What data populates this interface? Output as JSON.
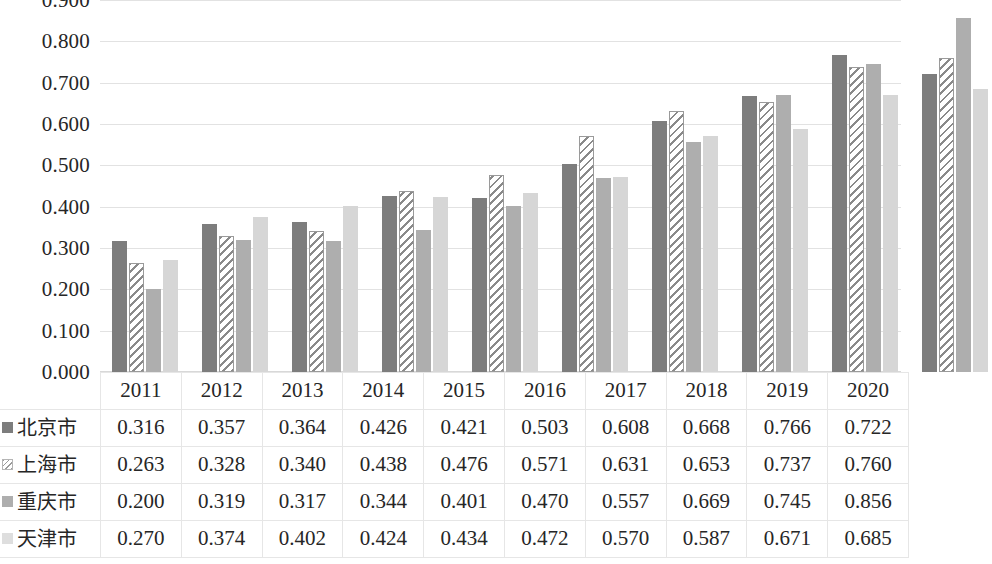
{
  "chart_data": {
    "type": "bar",
    "title": "",
    "xlabel": "",
    "ylabel": "",
    "ylim": [
      0.0,
      0.9
    ],
    "ytick_step": 0.1,
    "grid": true,
    "legend_position": "table-row-labels",
    "categories": [
      "2011",
      "2012",
      "2013",
      "2014",
      "2015",
      "2016",
      "2017",
      "2018",
      "2019",
      "2020"
    ],
    "series": [
      {
        "name": "北京市",
        "marker": "solid-dark-gray",
        "color": "#7d7d7d",
        "values": [
          0.316,
          0.357,
          0.364,
          0.426,
          0.421,
          0.503,
          0.608,
          0.668,
          0.766,
          0.722
        ]
      },
      {
        "name": "上海市",
        "marker": "diagonal-hatch-white",
        "color": "#ffffff",
        "values": [
          0.263,
          0.328,
          0.34,
          0.438,
          0.476,
          0.571,
          0.631,
          0.653,
          0.737,
          0.76
        ]
      },
      {
        "name": "重庆市",
        "marker": "solid-medium-gray",
        "color": "#aeaeae",
        "values": [
          0.2,
          0.319,
          0.317,
          0.344,
          0.401,
          0.47,
          0.557,
          0.669,
          0.745,
          0.856
        ]
      },
      {
        "name": "天津市",
        "marker": "solid-light-gray",
        "color": "#d6d6d6",
        "values": [
          0.27,
          0.374,
          0.402,
          0.424,
          0.434,
          0.472,
          0.57,
          0.587,
          0.671,
          0.685
        ]
      }
    ],
    "ytick_labels": [
      "0.900",
      "0.800",
      "0.700",
      "0.600",
      "0.500",
      "0.400",
      "0.300",
      "0.200",
      "0.100",
      "0.000"
    ],
    "ytick_values": [
      0.9,
      0.8,
      0.7,
      0.6,
      0.5,
      0.4,
      0.3,
      0.2,
      0.1,
      0.0
    ]
  },
  "table": {
    "corner_label": "",
    "column_headers": [
      "2011",
      "2012",
      "2013",
      "2014",
      "2015",
      "2016",
      "2017",
      "2018",
      "2019",
      "2020"
    ],
    "rows": [
      {
        "label": "北京市",
        "swatch": "sw1",
        "cells": [
          "0.316",
          "0.357",
          "0.364",
          "0.426",
          "0.421",
          "0.503",
          "0.608",
          "0.668",
          "0.766",
          "0.722"
        ]
      },
      {
        "label": "上海市",
        "swatch": "sw2",
        "cells": [
          "0.263",
          "0.328",
          "0.340",
          "0.438",
          "0.476",
          "0.571",
          "0.631",
          "0.653",
          "0.737",
          "0.760"
        ]
      },
      {
        "label": "重庆市",
        "swatch": "sw3",
        "cells": [
          "0.200",
          "0.319",
          "0.317",
          "0.344",
          "0.401",
          "0.470",
          "0.557",
          "0.669",
          "0.745",
          "0.856"
        ]
      },
      {
        "label": "天津市",
        "swatch": "sw4",
        "cells": [
          "0.270",
          "0.374",
          "0.402",
          "0.424",
          "0.434",
          "0.472",
          "0.570",
          "0.587",
          "0.671",
          "0.685"
        ]
      }
    ]
  },
  "colors": {
    "series1": "#7d7d7d",
    "series2": "#ffffff",
    "series3": "#aeaeae",
    "series4": "#d6d6d6",
    "gridline": "#e2e2e2",
    "text": "#262626",
    "background": "#ffffff"
  }
}
